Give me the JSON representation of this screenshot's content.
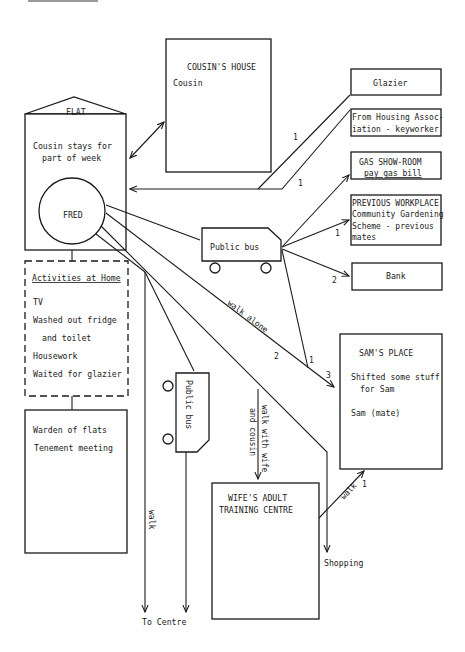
{
  "nodes": {
    "flat": {
      "roof_label": "FLAT",
      "line1": "Cousin stays for",
      "line2": "part of week",
      "person": "FRED"
    },
    "cousins_house": {
      "title": "COUSIN'S HOUSE",
      "body": "Cousin"
    },
    "glazier": {
      "label": "Glazier"
    },
    "housing_association": {
      "line1": "From Housing Assoc-",
      "line2": "iation - keyworker"
    },
    "gas_showroom": {
      "line1": "GAS SHOW-ROOM",
      "line2": "pay gas bill"
    },
    "previous_workplace": {
      "line1": "PREVIOUS WORKPLACE",
      "line2": "Community Gardening",
      "line3": "Scheme - previous",
      "line4": "mates"
    },
    "bank": {
      "label": "Bank"
    },
    "public_bus_horizontal": {
      "label": "Public bus"
    },
    "public_bus_vertical": {
      "label": "Public bus"
    },
    "activities_at_home": {
      "title": "Activities at Home",
      "items": [
        "TV",
        "Washed out fridge",
        "and toilet",
        "Housework",
        "Waited for glazier"
      ]
    },
    "warden_box": {
      "line1": "Warden of flats",
      "line2": "Tenement meeting"
    },
    "sams_place": {
      "title": "SAM'S PLACE",
      "line1": "Shifted some stuff",
      "line2": "for Sam",
      "line3": "Sam (mate)"
    },
    "wifes_centre": {
      "line1": "WIFE'S ADULT",
      "line2": "TRAINING CENTRE"
    },
    "shopping": {
      "label": "Shopping"
    },
    "to_centre": {
      "label": "To Centre"
    }
  },
  "edges": {
    "glazier_count": "1",
    "housing_count": "1",
    "workplace_count": "1",
    "bank_count": "2",
    "walk_alone_label": "walk alone",
    "walk_alone_count": "2",
    "bus_to_sams_count": "1",
    "sams_arrow_count": "3",
    "walk_with_wife_line1": "walk with wife",
    "walk_with_wife_line2": "and cousin",
    "walk_to_centre_label": "walk",
    "centre_to_sams_label": "walk",
    "centre_to_sams_count": "1"
  }
}
